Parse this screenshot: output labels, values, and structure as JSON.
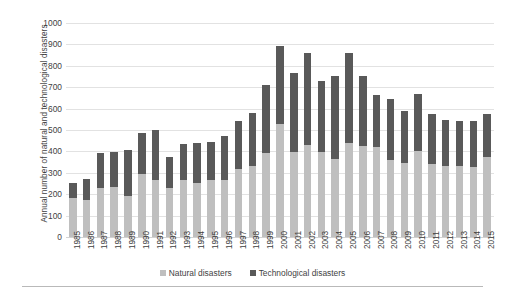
{
  "chart_data": {
    "type": "bar",
    "subtype": "stacked-column",
    "title": "",
    "xlabel": "",
    "ylabel": "Annual number of natural and technological disasters",
    "ylim": [
      0,
      1000
    ],
    "ytick_step": 100,
    "ytick_labels": [
      "1000",
      "900",
      "800",
      "700",
      "600",
      "500",
      "400",
      "300",
      "200",
      "100",
      "0"
    ],
    "grid": true,
    "legend_position": "bottom",
    "categories": [
      "1985",
      "1986",
      "1987",
      "1988",
      "1989",
      "1990",
      "1991",
      "1992",
      "1993",
      "1994",
      "1995",
      "1996",
      "1997",
      "1998",
      "1999",
      "2000",
      "2001",
      "2002",
      "2003",
      "2004",
      "2005",
      "2006",
      "2007",
      "2008",
      "2009",
      "2010",
      "2011",
      "2012",
      "2013",
      "2014",
      "2015"
    ],
    "series": [
      {
        "name": "Natural disasters",
        "color": "#bfbfbf",
        "values": [
          180,
          172,
          228,
          236,
          190,
          296,
          268,
          228,
          265,
          252,
          268,
          266,
          318,
          332,
          392,
          529,
          398,
          430,
          398,
          366,
          440,
          424,
          422,
          358,
          344,
          400,
          340,
          330,
          330,
          328,
          376
        ]
      },
      {
        "name": "Technological disasters",
        "color": "#595959",
        "values": [
          72,
          100,
          166,
          162,
          216,
          192,
          232,
          148,
          168,
          188,
          178,
          208,
          222,
          246,
          318,
          364,
          368,
          430,
          330,
          388,
          420,
          330,
          242,
          288,
          244,
          266,
          234,
          218,
          212,
          212,
          198
        ]
      }
    ],
    "totals": [
      252,
      272,
      394,
      398,
      406,
      488,
      500,
      376,
      433,
      440,
      446,
      474,
      540,
      578,
      710,
      893,
      766,
      860,
      728,
      754,
      860,
      754,
      664,
      646,
      588,
      666,
      574,
      548,
      542,
      540,
      574
    ]
  },
  "legend": {
    "items": [
      {
        "label": "Natural disasters",
        "color": "#bfbfbf"
      },
      {
        "label": "Technological disasters",
        "color": "#595959"
      }
    ]
  }
}
